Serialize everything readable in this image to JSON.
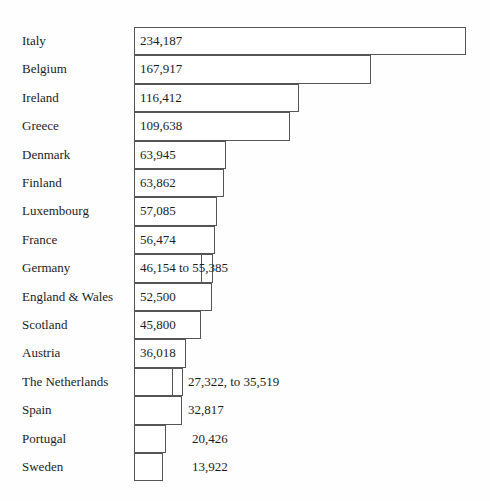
{
  "chart_data": {
    "type": "bar",
    "title": "",
    "subtitle": "",
    "xlabel": "",
    "ylabel": "",
    "orientation": "horizontal",
    "grid": false,
    "legend": null,
    "axis_visible": false,
    "value_unit": "count",
    "sorted": "descending",
    "xlim": [
      0,
      234187
    ],
    "categories": [
      "Italy",
      "Belgium",
      "Ireland",
      "Greece",
      "Denmark",
      "Finland",
      "Luxembourg",
      "France",
      "Germany",
      "England & Wales",
      "Scotland",
      "Austria",
      "The Netherlands",
      "Spain",
      "Portugal",
      "Sweden"
    ],
    "values": [
      234187,
      167917,
      116412,
      109638,
      63945,
      63862,
      57085,
      56474,
      55385,
      52500,
      45800,
      36018,
      35519,
      32817,
      20426,
      13922
    ],
    "rows": [
      {
        "label": "Italy",
        "value_text": "234,187",
        "value": 234187,
        "range": false,
        "label_position": "inside",
        "bar_px": 332
      },
      {
        "label": "Belgium",
        "value_text": "167,917",
        "value": 167917,
        "range": false,
        "label_position": "inside",
        "bar_px": 237
      },
      {
        "label": "Ireland",
        "value_text": "116,412",
        "value": 116412,
        "range": false,
        "label_position": "inside",
        "bar_px": 165
      },
      {
        "label": "Greece",
        "value_text": "109,638",
        "value": 109638,
        "range": false,
        "label_position": "inside",
        "bar_px": 156
      },
      {
        "label": "Denmark",
        "value_text": "63,945",
        "value": 63945,
        "range": false,
        "label_position": "inside",
        "bar_px": 92
      },
      {
        "label": "Finland",
        "value_text": "63,862",
        "value": 63862,
        "range": false,
        "label_position": "inside",
        "bar_px": 90
      },
      {
        "label": "Luxembourg",
        "value_text": "57,085",
        "value": 57085,
        "range": false,
        "label_position": "inside",
        "bar_px": 83
      },
      {
        "label": "France",
        "value_text": "56,474",
        "value": 56474,
        "range": false,
        "label_position": "inside",
        "bar_px": 81
      },
      {
        "label": "Germany",
        "value_text": "46,154 to 55,385",
        "value": 55385,
        "value_low": 46154,
        "value_high": 55385,
        "range": true,
        "label_position": "inside",
        "bar_px": 79,
        "bar_inner_px": 68
      },
      {
        "label": "England & Wales",
        "value_text": "52,500",
        "value": 52500,
        "range": false,
        "label_position": "inside",
        "bar_px": 78
      },
      {
        "label": "Scotland",
        "value_text": "45,800",
        "value": 45800,
        "range": false,
        "label_position": "inside",
        "bar_px": 67
      },
      {
        "label": "Austria",
        "value_text": "36,018",
        "value": 36018,
        "range": false,
        "label_position": "inside",
        "bar_px": 52
      },
      {
        "label": "The Netherlands",
        "value_text": "27,322, to 35,519",
        "value": 35519,
        "value_low": 27322,
        "value_high": 35519,
        "range": true,
        "label_position": "outside",
        "bar_px": 49,
        "bar_inner_px": 39,
        "value_left_px": 188
      },
      {
        "label": "Spain",
        "value_text": "32,817",
        "value": 32817,
        "range": false,
        "label_position": "outside",
        "bar_px": 48,
        "value_left_px": 188
      },
      {
        "label": "Portugal",
        "value_text": "20,426",
        "value": 20426,
        "range": false,
        "label_position": "outside",
        "bar_px": 32,
        "value_left_px": 192
      },
      {
        "label": "Sweden",
        "value_text": "13,922",
        "value": 13922,
        "range": false,
        "label_position": "outside",
        "bar_px": 29,
        "value_left_px": 192
      }
    ]
  },
  "style": {
    "bar_border_color": "#555555",
    "bar_fill_color": "#ffffff",
    "text_color": "#1c1c1c",
    "background_color": "#fefefe"
  }
}
